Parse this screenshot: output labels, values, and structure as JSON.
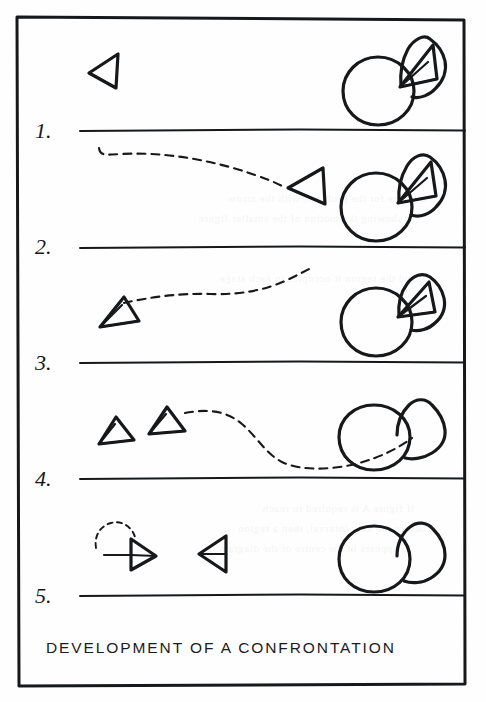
{
  "figure": {
    "caption": "DEVELOPMENT OF A CONFRONTATION",
    "medium": "hand-drawn ink diagram on paper (scanned page)",
    "frame_border": true,
    "ink_color": "#16181a",
    "paper_color": "#fefefe",
    "panel_count": 5,
    "step_labels": [
      "1.",
      "2.",
      "3.",
      "4.",
      "5."
    ]
  },
  "panels": [
    {
      "number": "1.",
      "label": "1.",
      "shapes": [
        {
          "name": "triangle-left-far",
          "kind": "triangle",
          "facing": "left",
          "position": "left"
        },
        {
          "name": "circle-defender",
          "kind": "circle",
          "position": "right"
        },
        {
          "name": "triangle-in-enclosure",
          "kind": "triangle",
          "facing": "left",
          "position": "attached-upper-right-of-circle"
        },
        {
          "name": "enclosure-blob",
          "kind": "enclosure",
          "state": "occupied",
          "position": "upper-right-of-circle"
        }
      ],
      "trajectories": []
    },
    {
      "number": "2.",
      "label": "2.",
      "shapes": [
        {
          "name": "triangle-approaching",
          "kind": "triangle",
          "facing": "left",
          "position": "center-right"
        },
        {
          "name": "circle-defender",
          "kind": "circle",
          "position": "right"
        },
        {
          "name": "triangle-in-enclosure",
          "kind": "triangle",
          "facing": "left",
          "position": "attached-upper-right-of-circle"
        },
        {
          "name": "enclosure-blob",
          "kind": "enclosure",
          "state": "occupied",
          "position": "upper-right-of-circle"
        }
      ],
      "trajectories": [
        {
          "name": "path-approach",
          "style": "dashed",
          "direction": "left-to-right"
        }
      ]
    },
    {
      "number": "3.",
      "label": "3.",
      "shapes": [
        {
          "name": "triangle-retreated",
          "kind": "triangle",
          "facing": "left",
          "position": "left"
        },
        {
          "name": "circle-defender",
          "kind": "circle",
          "position": "right"
        },
        {
          "name": "triangle-in-enclosure",
          "kind": "triangle",
          "facing": "left",
          "position": "attached-upper-right-of-circle"
        },
        {
          "name": "enclosure-blob",
          "kind": "enclosure",
          "state": "occupied",
          "position": "upper-right-of-circle"
        }
      ],
      "trajectories": [
        {
          "name": "path-retreat",
          "style": "dashed",
          "direction": "right-to-left"
        }
      ]
    },
    {
      "number": "4.",
      "label": "4.",
      "shapes": [
        {
          "name": "triangle-left-a",
          "kind": "triangle",
          "facing": "left",
          "position": "far-left"
        },
        {
          "name": "triangle-left-b",
          "kind": "triangle",
          "facing": "left",
          "position": "left"
        },
        {
          "name": "circle-defender",
          "kind": "circle",
          "position": "right"
        },
        {
          "name": "enclosure-blob",
          "kind": "enclosure",
          "state": "empty",
          "position": "upper-right-of-circle"
        }
      ],
      "trajectories": [
        {
          "name": "path-departure-s-curve",
          "style": "dashed",
          "direction": "right-to-left"
        }
      ]
    },
    {
      "number": "5.",
      "label": "5.",
      "shapes": [
        {
          "name": "triangle-facing-right",
          "kind": "triangle",
          "facing": "right",
          "position": "far-left"
        },
        {
          "name": "dashed-circle-ghost",
          "kind": "circle-outline",
          "style": "dashed",
          "position": "behind-far-left-triangle"
        },
        {
          "name": "triangle-facing-left",
          "kind": "triangle",
          "facing": "left",
          "position": "left-center"
        },
        {
          "name": "circle-defender",
          "kind": "circle",
          "position": "right"
        },
        {
          "name": "enclosure-blob",
          "kind": "enclosure",
          "state": "empty",
          "position": "upper-right-of-circle"
        }
      ],
      "trajectories": []
    }
  ],
  "bleed_through": [
    "a figure for the problem, with the arrow",
    "showing the motion of the smaller figure",
    "and the region it occupies in each stage",
    "if figure A is required to reach",
    "before the next interval, then a region",
    "appears in the centre of the diagram"
  ]
}
